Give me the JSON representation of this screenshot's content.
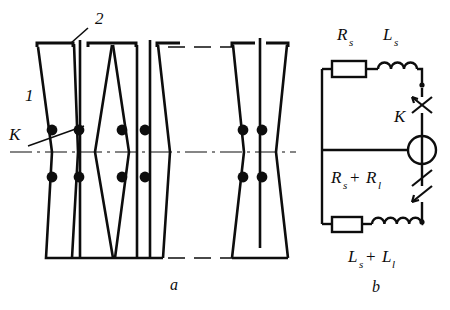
{
  "figure": {
    "title_not_shown": "",
    "panels": [
      {
        "id": "a",
        "caption": "a",
        "name": "winding-layout-diagram"
      },
      {
        "id": "b",
        "caption": "b",
        "name": "equivalent-circuit-diagram"
      }
    ]
  },
  "panel_a": {
    "caption": "a",
    "callouts": [
      {
        "name": "callout-1",
        "text": "1"
      },
      {
        "name": "callout-2",
        "text": "2"
      },
      {
        "name": "callout-k",
        "text": "K"
      }
    ]
  },
  "panel_b": {
    "caption": "b",
    "components": [
      {
        "name": "resistor-rs",
        "label": "R",
        "sub": "s"
      },
      {
        "name": "inductor-ls",
        "label": "L",
        "sub": "s"
      },
      {
        "name": "switch-k",
        "label": "K",
        "sub": ""
      },
      {
        "name": "source-circle",
        "label": "",
        "sub": ""
      },
      {
        "name": "resistor-rs-plus-rl",
        "label": "R",
        "sub": "s",
        "label2": "R",
        "sub2": "l",
        "op": "+"
      },
      {
        "name": "inductor-ls-plus-ll",
        "label": "L",
        "sub": "s",
        "label2": "L",
        "sub2": "l",
        "op": "+"
      }
    ],
    "labels": {
      "rs": "R",
      "rs_sub": "s",
      "ls": "L",
      "ls_sub": "s",
      "k": "K",
      "plus": "+",
      "r_sum_1": "R",
      "r_sum_1_sub": "s",
      "r_sum_2": "R",
      "r_sum_2_sub": "l",
      "l_sum_1": "L",
      "l_sum_1_sub": "s",
      "l_sum_2": "L",
      "l_sum_2_sub": "l"
    }
  },
  "colors": {
    "ink": "#0d0d0d",
    "background": "#ffffff"
  }
}
